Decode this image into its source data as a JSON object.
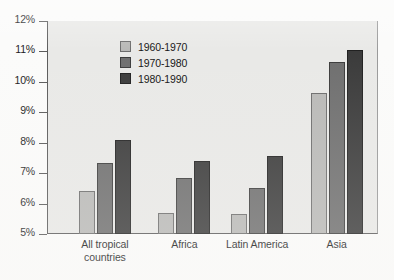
{
  "chart_data": {
    "type": "bar",
    "title": "",
    "subtitle": "",
    "xlabel": "",
    "ylabel": "",
    "ylim": [
      5,
      12
    ],
    "ytick_labels": [
      "12%",
      "11%",
      "10%",
      "9%",
      "8%",
      "7%",
      "6%",
      "5%"
    ],
    "ytick_values": [
      12,
      11,
      10,
      9,
      8,
      7,
      6,
      5
    ],
    "ytick_suffix": "%",
    "grid": false,
    "legend_position": "inside-top-left",
    "categories": [
      "All tropical\ncountries",
      "Africa",
      "Latin America",
      "Asia"
    ],
    "series": [
      {
        "name": "1960-1970",
        "color": "#b9b9b7",
        "values": [
          6.4,
          5.7,
          5.65,
          9.65
        ]
      },
      {
        "name": "1970-1980",
        "color": "#6f6f6f",
        "values": [
          7.35,
          6.85,
          6.5,
          10.65
        ]
      },
      {
        "name": "1980-1990",
        "color": "#3b3b3b",
        "values": [
          8.1,
          7.4,
          7.55,
          11.05
        ]
      }
    ]
  },
  "legend": {
    "items": [
      {
        "label": "1960-1970"
      },
      {
        "label": "1970-1980"
      },
      {
        "label": "1980-1990"
      }
    ]
  },
  "axes": {
    "y_labels": [
      "12%",
      "11%",
      "10%",
      "9%",
      "8%",
      "7%",
      "6%",
      "5%"
    ],
    "x_labels": [
      "All tropical\ncountries",
      "Africa",
      "Latin America",
      "Asia"
    ]
  }
}
